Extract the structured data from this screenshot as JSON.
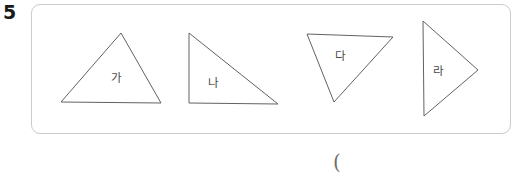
{
  "page": {
    "question_number": "5",
    "answer_paren": "("
  },
  "panel": {
    "border_color": "#c9cbcc",
    "background_color": "#ffffff",
    "stroke_color": "#5f6365",
    "label_color": "#4a4a4a"
  },
  "shapes": [
    {
      "id": "triangle-ga",
      "label": "가",
      "kind": "acute-triangle",
      "points": "61,102 121,33 161,103",
      "label_x": 116,
      "label_y": 78
    },
    {
      "id": "triangle-na",
      "label": "나",
      "kind": "right-triangle",
      "points": "189,33 189,103 278,104",
      "label_x": 213,
      "label_y": 83
    },
    {
      "id": "triangle-da",
      "label": "다",
      "kind": "inverted-triangle",
      "points": "307,34 393,37 334,102",
      "label_x": 340,
      "label_y": 56
    },
    {
      "id": "triangle-ra",
      "label": "라",
      "kind": "right-pointing-triangle",
      "points": "423,21 478,70 424,116",
      "label_x": 438,
      "label_y": 71
    }
  ]
}
